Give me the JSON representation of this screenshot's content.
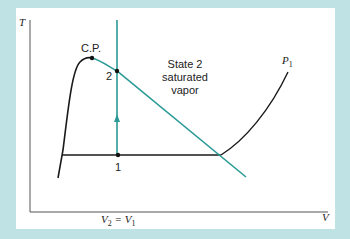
{
  "diagram": {
    "type": "T-V phase diagram",
    "axes": {
      "y_label": "T",
      "x_label": "V"
    },
    "labels": {
      "critical_point": "C.P.",
      "state2_number": "2",
      "state1_number": "1",
      "state2_line1": "State 2",
      "state2_line2": "saturated",
      "state2_line3": "vapor",
      "isobar_main": "P",
      "isobar_sub": "1",
      "volume_eq_v": "V",
      "volume_eq_sub2": "2",
      "volume_eq_mid": " = V",
      "volume_eq_sub1": "1"
    },
    "colors": {
      "background": "#bfe2e5",
      "panel": "#ffffff",
      "curve": "#1a1a1a",
      "process": "#2a9a96",
      "axis": "#555555"
    },
    "points": [
      {
        "name": "C.P.",
        "x": 92,
        "y": 58
      },
      {
        "name": "2",
        "x": 117,
        "y": 71
      },
      {
        "name": "1",
        "x": 118,
        "y": 155
      }
    ]
  }
}
